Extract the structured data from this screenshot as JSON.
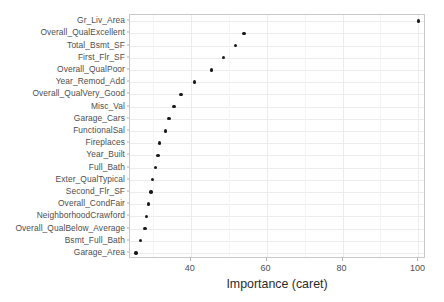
{
  "chart_data": {
    "type": "scatter",
    "title": "",
    "subtitle": "",
    "xlabel": "Importance (caret)",
    "ylabel": "",
    "orientation": "horizontal",
    "grid": true,
    "legend": null,
    "xlim": [
      24,
      102
    ],
    "x_ticks": [
      40,
      60,
      80,
      100
    ],
    "x_tick_labels": [
      "40",
      "60",
      "80",
      "100"
    ],
    "x_minor_ticks": [
      30,
      50,
      70,
      90
    ],
    "categories": [
      "Gr_Liv_Area",
      "Overall_QualExcellent",
      "Total_Bsmt_SF",
      "First_Flr_SF",
      "Overall_QualPoor",
      "Year_Remod_Add",
      "Overall_QualVery_Good",
      "Misc_Val",
      "Garage_Cars",
      "FunctionalSal",
      "Fireplaces",
      "Year_Built",
      "Full_Bath",
      "Exter_QualTypical",
      "Second_Flr_SF",
      "Overall_CondFair",
      "NeighborhoodCrawford",
      "Overall_QualBelow_Average",
      "Bsmt_Full_Bath",
      "Garage_Area"
    ],
    "values": [
      100.0,
      54.0,
      51.8,
      48.7,
      45.5,
      41.0,
      37.4,
      35.6,
      34.3,
      33.4,
      31.8,
      31.4,
      30.7,
      30.0,
      29.5,
      28.9,
      28.3,
      27.9,
      26.7,
      25.6
    ],
    "point_color": "#1a1a1a",
    "panel_background": "#ffffff",
    "grid_color": "#ececec"
  }
}
